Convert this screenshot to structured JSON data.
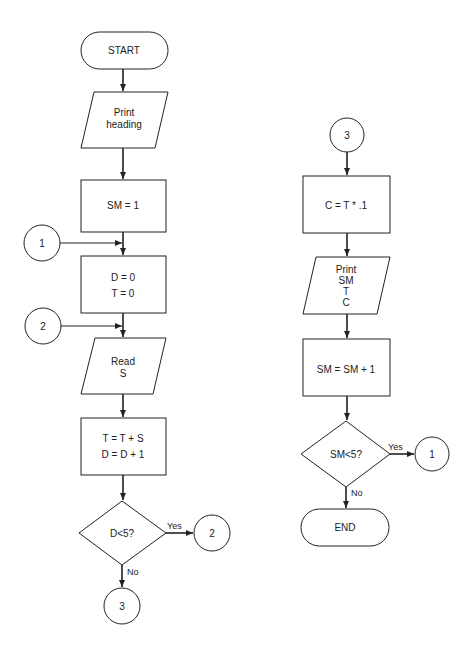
{
  "diagram": {
    "left_column": {
      "start": "START",
      "print_heading": [
        "Print",
        "heading"
      ],
      "init_sm": "SM = 1",
      "connector_1_in": "1",
      "init_dt": [
        "D = 0",
        "T = 0"
      ],
      "connector_2_in": "2",
      "read": [
        "Read",
        "S"
      ],
      "accumulate": [
        "T = T + S",
        "D = D + 1"
      ],
      "decision": "D<5?",
      "yes_label": "Yes",
      "no_label": "No",
      "connector_2_out": "2",
      "connector_3_out": "3"
    },
    "right_column": {
      "connector_3_in": "3",
      "compute_c": "C = T * .1",
      "print_results": [
        "Print",
        "SM",
        "T",
        "C"
      ],
      "increment_sm": "SM = SM + 1",
      "decision": "SM<5?",
      "yes_label": "Yes",
      "no_label": "No",
      "connector_1_out": "1",
      "end": "END"
    },
    "colors": {
      "line": "#222222",
      "background": "#ffffff"
    }
  }
}
